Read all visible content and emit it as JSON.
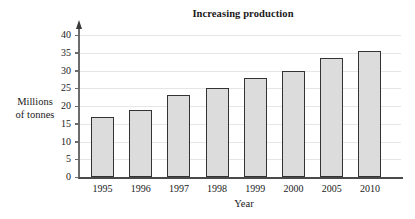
{
  "chart_data": {
    "type": "bar",
    "title": "Increasing production",
    "xlabel": "Year",
    "ylabel": "Millions of tonnes",
    "ylabel_lines": [
      "Millions",
      "of tonnes"
    ],
    "categories": [
      "1995",
      "1996",
      "1997",
      "1998",
      "1999",
      "2000",
      "2005",
      "2010"
    ],
    "values": [
      17,
      19,
      23,
      25,
      28,
      30,
      33.5,
      35.5
    ],
    "ylim": [
      0,
      40
    ],
    "ytick_labels": [
      "0",
      "5",
      "10",
      "15",
      "20",
      "25",
      "30",
      "35",
      "40"
    ],
    "ytick_values": [
      0,
      5,
      10,
      15,
      20,
      25,
      30,
      35,
      40
    ],
    "grid": true,
    "legend": null,
    "bar_fill_color": "#dcdcdc",
    "bar_border_color": "#333333",
    "gridline_color": "#e6e6e6",
    "axis_color": "#4a4a4a",
    "background_color": "#ffffff"
  }
}
